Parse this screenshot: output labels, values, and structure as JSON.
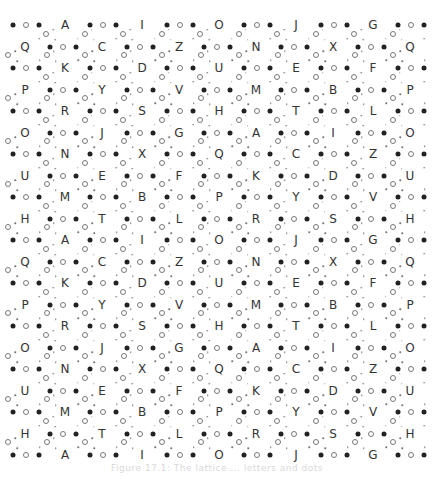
{
  "figure": {
    "rows": [
      [
        "A",
        "I",
        "O",
        "J",
        "G"
      ],
      [
        "Q",
        "C",
        "Z",
        "N",
        "X",
        "Q"
      ],
      [
        "K",
        "D",
        "U",
        "E",
        "F"
      ],
      [
        "P",
        "Y",
        "V",
        "M",
        "B",
        "P"
      ],
      [
        "R",
        "S",
        "H",
        "T",
        "L"
      ],
      [
        "O",
        "J",
        "G",
        "A",
        "I",
        "O"
      ],
      [
        "N",
        "X",
        "Q",
        "C",
        "Z"
      ],
      [
        "U",
        "E",
        "F",
        "K",
        "D",
        "U"
      ],
      [
        "M",
        "B",
        "P",
        "Y",
        "V"
      ],
      [
        "H",
        "T",
        "L",
        "R",
        "S",
        "H"
      ],
      [
        "A",
        "I",
        "O",
        "J",
        "G"
      ],
      [
        "Q",
        "C",
        "Z",
        "N",
        "X",
        "Q"
      ],
      [
        "K",
        "D",
        "U",
        "E",
        "F"
      ],
      [
        "P",
        "Y",
        "V",
        "M",
        "B",
        "P"
      ],
      [
        "R",
        "S",
        "H",
        "T",
        "L"
      ],
      [
        "O",
        "J",
        "G",
        "A",
        "I",
        "O"
      ],
      [
        "N",
        "X",
        "Q",
        "C",
        "Z"
      ],
      [
        "U",
        "E",
        "F",
        "K",
        "D",
        "U"
      ],
      [
        "M",
        "B",
        "P",
        "Y",
        "V"
      ],
      [
        "H",
        "T",
        "L",
        "R",
        "S",
        "H"
      ],
      [
        "A",
        "I",
        "O",
        "J",
        "G"
      ]
    ],
    "caption": "Figure 17.1: The lattice ... letters and dots"
  }
}
